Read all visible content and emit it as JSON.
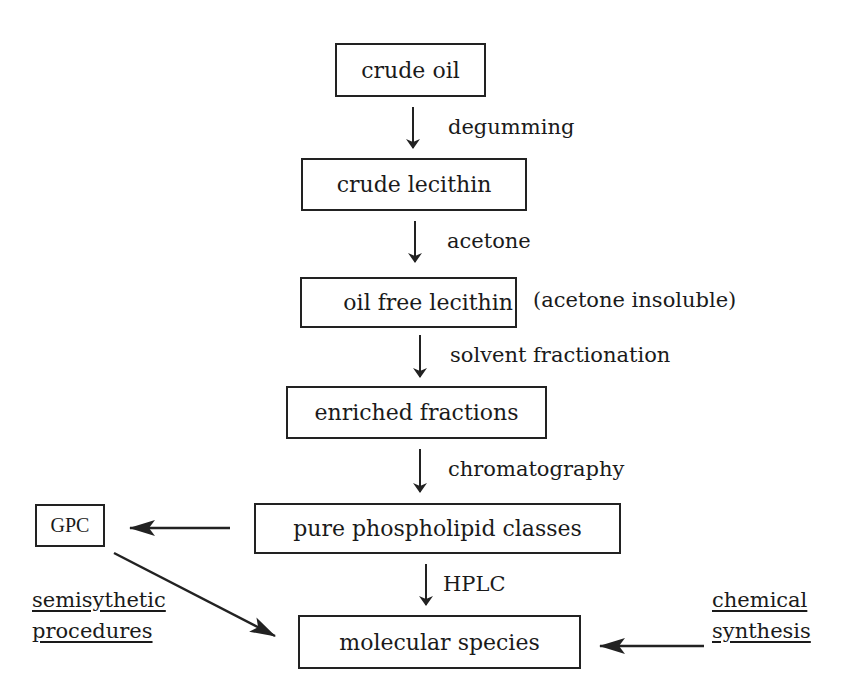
{
  "diagram": {
    "type": "flowchart",
    "title": "",
    "steps": [
      {
        "id": "crude_oil",
        "label": "crude oil"
      },
      {
        "id": "crude_lecithin",
        "label": "crude lecithin"
      },
      {
        "id": "oil_free_lecithin",
        "label": "oil free lecithin",
        "note": "(acetone insoluble)"
      },
      {
        "id": "enriched_fractions",
        "label": "enriched fractions"
      },
      {
        "id": "pure_phospholipid_classes",
        "label": "pure phospholipid classes"
      },
      {
        "id": "molecular_species",
        "label": "molecular species"
      }
    ],
    "processes": [
      {
        "from": "crude_oil",
        "to": "crude_lecithin",
        "label": "degumming"
      },
      {
        "from": "crude_lecithin",
        "to": "oil_free_lecithin",
        "label": "acetone"
      },
      {
        "from": "oil_free_lecithin",
        "to": "enriched_fractions",
        "label": "solvent fractionation"
      },
      {
        "from": "enriched_fractions",
        "to": "pure_phospholipid_classes",
        "label": "chromatography"
      },
      {
        "from": "pure_phospholipid_classes",
        "to": "molecular_species",
        "label": "HPLC"
      }
    ],
    "side_nodes": {
      "gpc": {
        "label": "GPC"
      },
      "semisynthetic": {
        "line1": "semisythetic",
        "line2": "procedures"
      },
      "chemical": {
        "line1": "chemical",
        "line2": "synthesis"
      }
    },
    "side_edges": [
      {
        "from": "pure_phospholipid_classes",
        "to": "gpc"
      },
      {
        "from": "gpc",
        "to": "molecular_species"
      },
      {
        "from": "chemical",
        "to": "molecular_species"
      }
    ],
    "colors": {
      "line": "#222222",
      "background": "#ffffff"
    }
  }
}
